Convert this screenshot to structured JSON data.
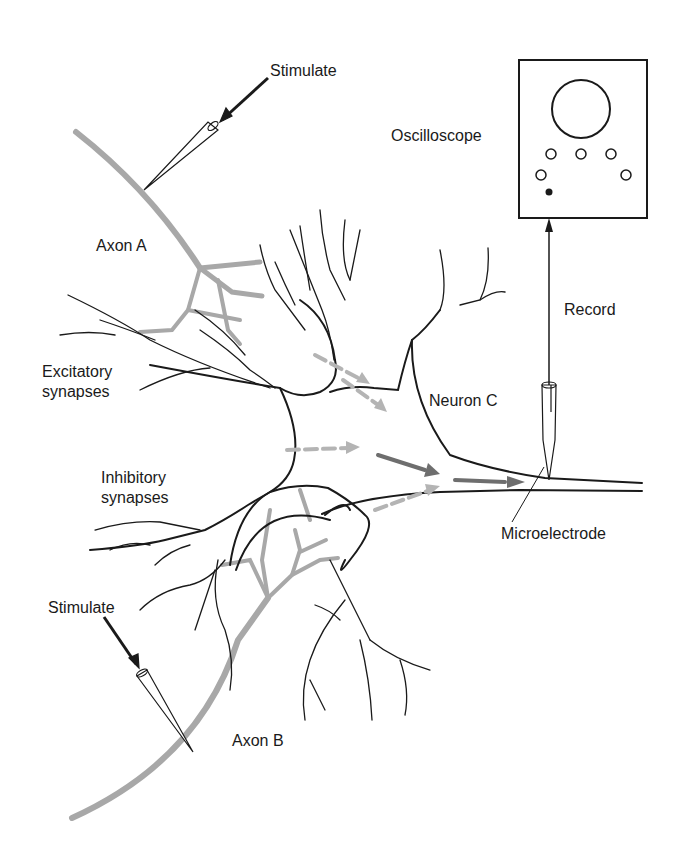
{
  "diagram": {
    "type": "neuron-synaptic-integration-schematic",
    "labels": {
      "stimulate_top": "Stimulate",
      "axon_a": "Axon A",
      "excitatory_line1": "Excitatory",
      "excitatory_line2": "synapses",
      "inhibitory_line1": "Inhibitory",
      "inhibitory_line2": "synapses",
      "stimulate_bottom": "Stimulate",
      "axon_b": "Axon B",
      "oscilloscope": "Oscilloscope",
      "record": "Record",
      "neuron_c": "Neuron C",
      "microelectrode": "Microelectrode"
    },
    "colors": {
      "line": "#1a1a1a",
      "axon_gray": "#a8a8a8",
      "arrow_light": "#b4b4b4",
      "arrow_dark": "#6e6e6e",
      "background": "#ffffff"
    },
    "oscilloscope": {
      "screen": "circle",
      "knobs_open": 5,
      "knobs_filled": 1
    }
  }
}
